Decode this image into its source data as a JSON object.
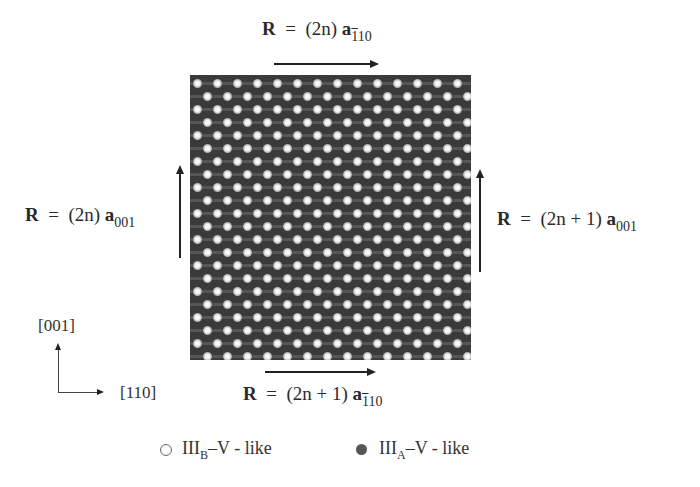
{
  "figure": {
    "top_label": {
      "R": "R",
      "eq": "=",
      "coef": "(2n)",
      "vec": "a",
      "sub_bar": "1",
      "sub_rest": "10"
    },
    "bottom_label": {
      "R": "R",
      "eq": "=",
      "coef": "(2n + 1)",
      "vec": "a",
      "sub_bar": "1",
      "sub_rest": "10"
    },
    "left_label": {
      "R": "R",
      "eq": "=",
      "coef": "(2n)",
      "vec": "a",
      "sub": "001"
    },
    "right_label": {
      "R": "R",
      "eq": "=",
      "coef": "(2n + 1)",
      "vec": "a",
      "sub": "001"
    },
    "axes": {
      "vertical": "[001]",
      "horizontal_open": "[",
      "horizontal_bar": "1",
      "horizontal_rest": "10]"
    },
    "legend": [
      {
        "symbol": "open-circle",
        "label_main": "III",
        "label_sub": "B",
        "label_rest": "–V - like"
      },
      {
        "symbol": "filled-circle",
        "label_main": "III",
        "label_sub": "A",
        "label_rest": "–V - like"
      }
    ],
    "lattice": {
      "rows": 22,
      "cols": 14,
      "dx": 20,
      "dy": 13,
      "background": "#3a3a3a",
      "dot_color": "#ffffff"
    }
  }
}
